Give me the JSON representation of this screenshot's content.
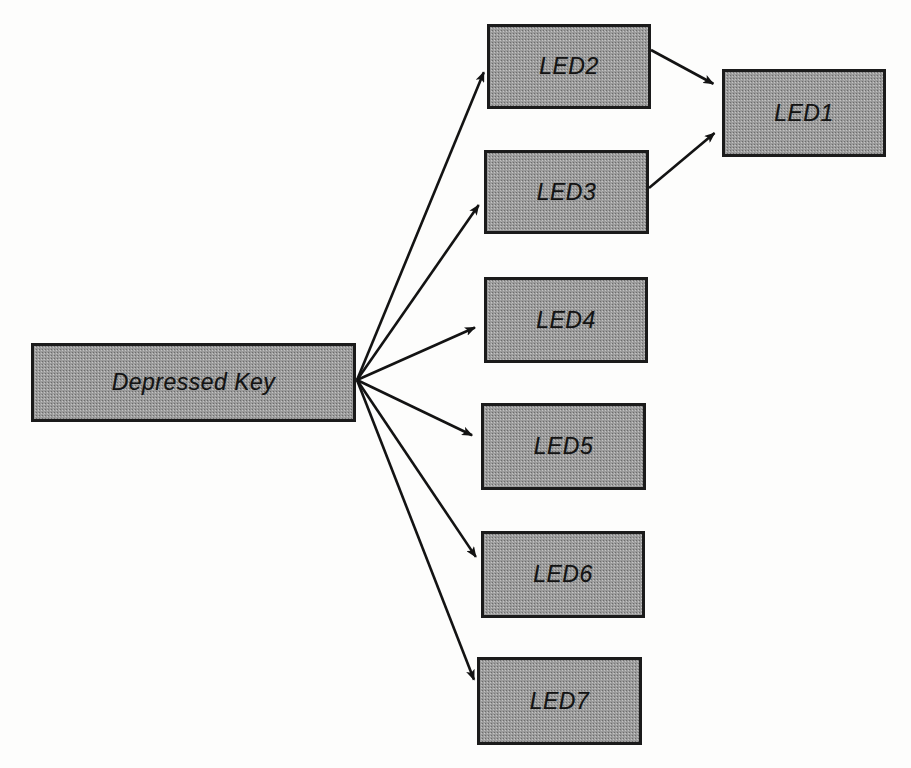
{
  "diagram": {
    "type": "flow-diagram",
    "background_color": "#fdfdfc",
    "node_fill_color": "#9b9b9b",
    "node_border_color": "#1b1b1b",
    "edge_color": "#131313",
    "nodes": [
      {
        "id": "source",
        "label": "Depressed Key",
        "x": 31,
        "y": 343,
        "w": 325,
        "h": 79
      },
      {
        "id": "led2",
        "label": "LED2",
        "x": 487,
        "y": 24,
        "w": 164,
        "h": 85
      },
      {
        "id": "led1",
        "label": "LED1",
        "x": 722,
        "y": 69,
        "w": 164,
        "h": 88
      },
      {
        "id": "led3",
        "label": "LED3",
        "x": 484,
        "y": 150,
        "w": 165,
        "h": 84
      },
      {
        "id": "led4",
        "label": "LED4",
        "x": 484,
        "y": 277,
        "w": 164,
        "h": 86
      },
      {
        "id": "led5",
        "label": "LED5",
        "x": 481,
        "y": 403,
        "w": 165,
        "h": 87
      },
      {
        "id": "led6",
        "label": "LED6",
        "x": 481,
        "y": 531,
        "w": 164,
        "h": 87
      },
      {
        "id": "led7",
        "label": "LED7",
        "x": 477,
        "y": 657,
        "w": 165,
        "h": 88
      }
    ],
    "edges": [
      {
        "id": "source-led2",
        "from": "source",
        "to": "led2",
        "x1": 357,
        "y1": 380,
        "x2": 488,
        "y2": 62
      },
      {
        "id": "source-led3",
        "from": "source",
        "to": "led3",
        "x1": 357,
        "y1": 380,
        "x2": 485,
        "y2": 196
      },
      {
        "id": "source-led4",
        "from": "source",
        "to": "led4",
        "x1": 357,
        "y1": 380,
        "x2": 485,
        "y2": 323
      },
      {
        "id": "source-led5",
        "from": "source",
        "to": "led5",
        "x1": 357,
        "y1": 380,
        "x2": 482,
        "y2": 440
      },
      {
        "id": "source-led6",
        "from": "source",
        "to": "led6",
        "x1": 357,
        "y1": 380,
        "x2": 482,
        "y2": 566
      },
      {
        "id": "source-led7",
        "from": "source",
        "to": "led7",
        "x1": 357,
        "y1": 380,
        "x2": 478,
        "y2": 690
      },
      {
        "id": "led2-led1",
        "from": "led2",
        "to": "led1",
        "x1": 651,
        "y1": 50,
        "x2": 723,
        "y2": 89
      },
      {
        "id": "led3-led1",
        "from": "led3",
        "to": "led1",
        "x1": 649,
        "y1": 188,
        "x2": 723,
        "y2": 126
      }
    ]
  }
}
